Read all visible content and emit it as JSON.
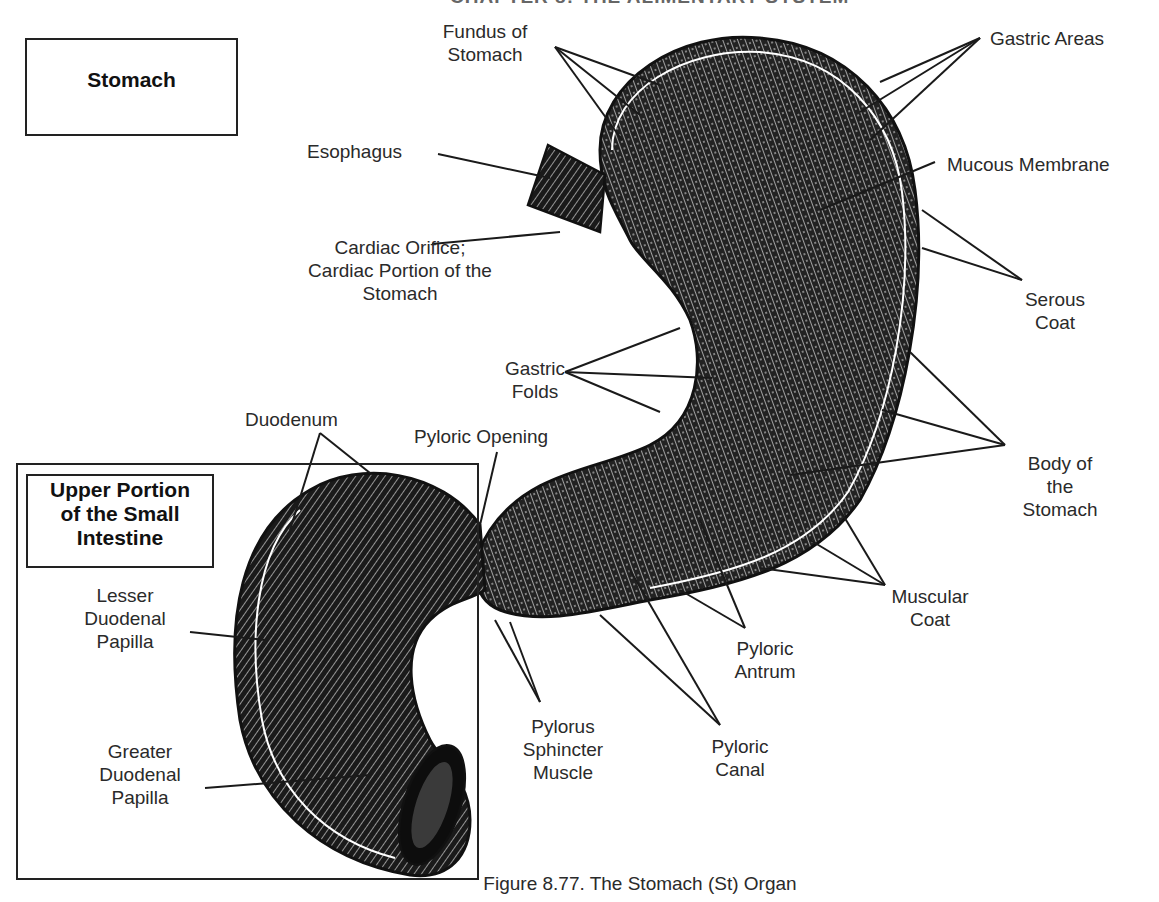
{
  "header_fragment": "CHAPTER 8: THE ALIMENTARY SYSTEM",
  "title_box": "Stomach",
  "subsection_box": "Upper Portion of the Small Intestine",
  "caption": "Figure 8.77. The Stomach (St) Organ",
  "labels": {
    "fundus": "Fundus of Stomach",
    "fundus_l1": "Fundus of",
    "fundus_l2": "Stomach",
    "gastric_areas": "Gastric Areas",
    "esophagus": "Esophagus",
    "mucous_membrane": "Mucous Membrane",
    "cardiac_l1": "Cardiac Orifice;",
    "cardiac_l2": "Cardiac Portion of the",
    "cardiac_l3": "Stomach",
    "serous_l1": "Serous",
    "serous_l2": "Coat",
    "gastric_folds_l1": "Gastric",
    "gastric_folds_l2": "Folds",
    "duodenum": "Duodenum",
    "pyloric_opening": "Pyloric Opening",
    "body_l1": "Body of",
    "body_l2": "the",
    "body_l3": "Stomach",
    "lesser_l1": "Lesser",
    "lesser_l2": "Duodenal",
    "lesser_l3": "Papilla",
    "muscular_l1": "Muscular",
    "muscular_l2": "Coat",
    "antrum_l1": "Pyloric",
    "antrum_l2": "Antrum",
    "greater_l1": "Greater",
    "greater_l2": "Duodenal",
    "greater_l3": "Papilla",
    "pylorus_l1": "Pylorus",
    "pylorus_l2": "Sphincter",
    "pylorus_l3": "Muscle",
    "canal_l1": "Pyloric",
    "canal_l2": "Canal"
  },
  "box_titles": {
    "upper_l1": "Upper Portion",
    "upper_l2": "of the Small",
    "upper_l3": "Intestine"
  }
}
